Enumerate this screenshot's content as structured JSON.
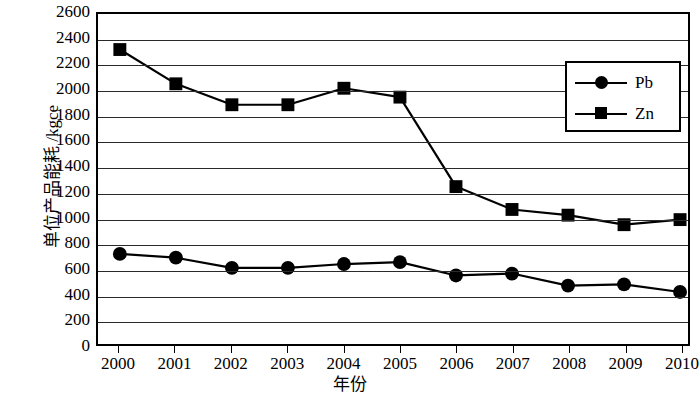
{
  "chart_data": {
    "type": "line",
    "title": "",
    "xlabel": "年份",
    "ylabel": "单位产品能耗 /kgce",
    "x": [
      2000,
      2001,
      2002,
      2003,
      2004,
      2005,
      2006,
      2007,
      2008,
      2009,
      2010
    ],
    "categories": [
      "2000",
      "2001",
      "2002",
      "2003",
      "2004",
      "2005",
      "2006",
      "2007",
      "2008",
      "2009",
      "2010"
    ],
    "series": [
      {
        "name": "Pb",
        "marker": "circle",
        "color": "#000000",
        "values": [
          710,
          680,
          600,
          600,
          630,
          645,
          540,
          555,
          460,
          470,
          410
        ]
      },
      {
        "name": "Zn",
        "marker": "square",
        "color": "#000000",
        "values": [
          2320,
          2050,
          1885,
          1885,
          2015,
          1945,
          1240,
          1060,
          1015,
          940,
          980
        ]
      }
    ],
    "ylim": [
      0,
      2600
    ],
    "ytick_step": 200,
    "yticks": [
      2600,
      2400,
      2200,
      2000,
      1800,
      1600,
      1400,
      1200,
      1000,
      800,
      600,
      400,
      200,
      0
    ],
    "ytick_labels": [
      "2600",
      "2400",
      "2200",
      "2000",
      "1800",
      "1600",
      "1400",
      "1200",
      "1000",
      "800",
      "600",
      "400",
      "200",
      "0"
    ],
    "grid": true,
    "grid_axis": "y",
    "legend_position": "upper-right",
    "legend_entries": [
      "Pb",
      "Zn"
    ]
  }
}
